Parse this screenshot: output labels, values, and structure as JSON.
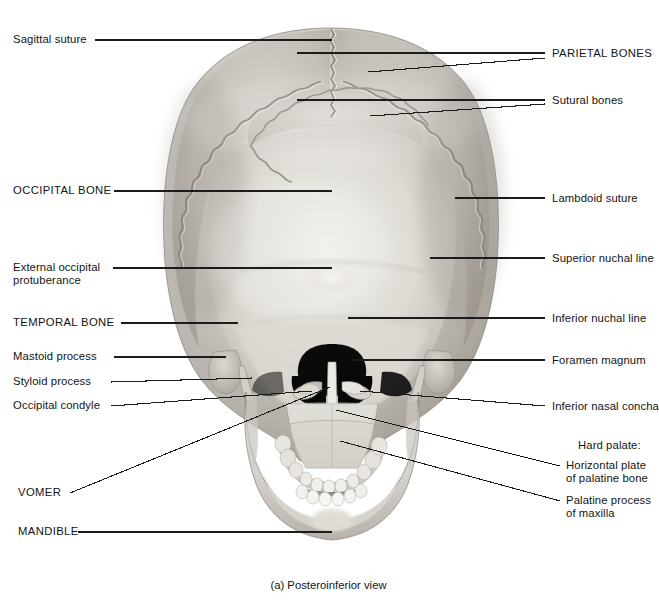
{
  "figure": {
    "caption": "(a) Posteroinferior view",
    "view": "Posteroinferior view of the skull",
    "panel_letter": "(a)"
  },
  "labels_left": [
    {
      "id": "sagittal-suture",
      "text": "Sagittal suture",
      "style": "mixed"
    },
    {
      "id": "occipital-bone",
      "text": "OCCIPITAL BONE",
      "style": "caps"
    },
    {
      "id": "external-occipital-protuberance-1",
      "text": "External occipital",
      "style": "mixed"
    },
    {
      "id": "external-occipital-protuberance-2",
      "text": "protuberance",
      "style": "mixed"
    },
    {
      "id": "temporal-bone",
      "text": "TEMPORAL BONE",
      "style": "caps"
    },
    {
      "id": "mastoid-process",
      "text": "Mastoid process",
      "style": "mixed"
    },
    {
      "id": "styloid-process",
      "text": "Styloid process",
      "style": "mixed"
    },
    {
      "id": "occipital-condyle",
      "text": "Occipital condyle",
      "style": "mixed"
    },
    {
      "id": "vomer",
      "text": "VOMER",
      "style": "caps"
    },
    {
      "id": "mandible",
      "text": "MANDIBLE",
      "style": "caps"
    }
  ],
  "labels_right": [
    {
      "id": "parietal-bones",
      "text": "PARIETAL BONES",
      "style": "caps"
    },
    {
      "id": "sutural-bones",
      "text": "Sutural bones",
      "style": "mixed"
    },
    {
      "id": "lambdoid-suture",
      "text": "Lambdoid suture",
      "style": "mixed"
    },
    {
      "id": "superior-nuchal-line",
      "text": "Superior nuchal line",
      "style": "mixed"
    },
    {
      "id": "inferior-nuchal-line",
      "text": "Inferior nuchal line",
      "style": "mixed"
    },
    {
      "id": "foramen-magnum",
      "text": "Foramen magnum",
      "style": "mixed"
    },
    {
      "id": "inferior-nasal-concha",
      "text": "Inferior nasal concha",
      "style": "mixed"
    },
    {
      "id": "hard-palate-heading",
      "text": "Hard palate:",
      "style": "mixed"
    },
    {
      "id": "horizontal-plate-1",
      "text": "Horizontal plate",
      "style": "mixed"
    },
    {
      "id": "horizontal-plate-2",
      "text": "of palatine bone",
      "style": "mixed"
    },
    {
      "id": "palatine-process-1",
      "text": "Palatine process",
      "style": "mixed"
    },
    {
      "id": "palatine-process-2",
      "text": "of maxilla",
      "style": "mixed"
    }
  ],
  "colors": {
    "background": "#ffffff",
    "text": "#141414",
    "leader_line": "#1b1b1b",
    "bone_light": "#e9e7e3",
    "bone_mid": "#cfcbc5",
    "bone_shadow": "#a9a49d",
    "bone_deep_shadow": "#8a857e",
    "cavity_black": "#0a0a0a",
    "tooth_white": "#f4f2ee"
  }
}
